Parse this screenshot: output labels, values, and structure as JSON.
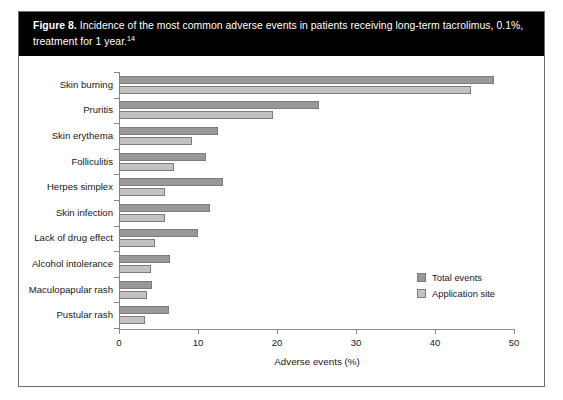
{
  "figure": {
    "label": "Figure 8.",
    "caption": " Incidence of the most common adverse events in patients receiving long-term tacrolimus, 0.1%, treatment for 1 year.",
    "reference_superscript": "14"
  },
  "colors": {
    "total_events": "#989898",
    "application_site": "#c2c2c2",
    "axis": "#8a8a8a",
    "caption_background": "#000000",
    "caption_text": "#ffffff",
    "frame_border": "#6e6e6e"
  },
  "legend": {
    "position": "bottom-right",
    "entries": [
      {
        "label": "Total events",
        "swatch": "total"
      },
      {
        "label": "Application site",
        "swatch": "appsite"
      }
    ]
  },
  "chart_data": {
    "type": "bar",
    "orientation": "horizontal",
    "title": "Incidence of the most common adverse events in patients receiving long-term tacrolimus, 0.1%, treatment for 1 year.",
    "xlabel": "Adverse events (%)",
    "ylabel": "",
    "xlim": [
      0,
      50
    ],
    "xticks": [
      0,
      10,
      20,
      30,
      40,
      50
    ],
    "xtick_labels": [
      "0",
      "10",
      "20",
      "30",
      "40",
      "50"
    ],
    "grid": false,
    "categories": [
      "Skin burning",
      "Pruritis",
      "Skin erythema",
      "Folliculitis",
      "Herpes simplex",
      "Skin infection",
      "Lack of drug effect",
      "Alcohol intolerance",
      "Maculopapular rash",
      "Pustular rash"
    ],
    "series": [
      {
        "name": "Total events",
        "color": "#989898",
        "values": [
          47.5,
          25.3,
          12.5,
          11.0,
          13.2,
          11.5,
          10.0,
          6.5,
          4.2,
          6.3
        ]
      },
      {
        "name": "Application site",
        "color": "#c2c2c2",
        "values": [
          44.5,
          19.5,
          9.2,
          7.0,
          5.8,
          5.8,
          4.5,
          4.0,
          3.6,
          3.3
        ]
      }
    ]
  }
}
